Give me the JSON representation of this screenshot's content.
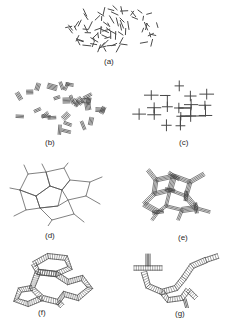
{
  "figure": {
    "background_color": "#ffffff",
    "ink_color": "#4a4a4a",
    "label_color": "#2b2b2b",
    "width": 232,
    "height": 321
  },
  "panels": [
    {
      "id": "a",
      "label": "(a)",
      "label_x": 104,
      "label_y": 58,
      "x": 62,
      "y": 4,
      "w": 108,
      "h": 52,
      "motif": "scattered-short-segments",
      "description": "Randomly oriented isolated short line segments dispersed in an elliptical cloud"
    },
    {
      "id": "b",
      "label": "(b)",
      "label_x": 45,
      "label_y": 139,
      "x": 8,
      "y": 78,
      "w": 104,
      "h": 58,
      "motif": "small-bundles",
      "description": "Short segments aggregated into small hatched bundles of parallel lines"
    },
    {
      "id": "c",
      "label": "(c)",
      "label_x": 179,
      "label_y": 139,
      "x": 126,
      "y": 78,
      "w": 100,
      "h": 58,
      "motif": "orthogonal-lattice",
      "description": "Rectilinear network of T-junction crosslinked segments"
    },
    {
      "id": "d",
      "label": "(d)",
      "label_x": 45,
      "label_y": 232,
      "x": 8,
      "y": 160,
      "w": 104,
      "h": 66,
      "motif": "thin-line-network",
      "description": "Open network of thin lines forming irregular polygonal cells"
    },
    {
      "id": "e",
      "label": "(e)",
      "label_x": 178,
      "label_y": 234,
      "x": 126,
      "y": 160,
      "w": 100,
      "h": 66,
      "motif": "hatched-bundle-network",
      "description": "Thick hatched bundles joined at T-junctions forming a coarse network"
    },
    {
      "id": "f",
      "label": "(f)",
      "label_x": 38,
      "label_y": 309,
      "x": 8,
      "y": 248,
      "w": 104,
      "h": 60,
      "motif": "ribbon-loops",
      "description": "Thick hatched ribbons forming closed polygonal loops"
    },
    {
      "id": "g",
      "label": "(g)",
      "label_x": 175,
      "label_y": 310,
      "x": 126,
      "y": 248,
      "w": 100,
      "h": 60,
      "motif": "ribbon-chain",
      "description": "Thick hatched ribbon chain with a T-shaped branch crossbar"
    }
  ]
}
